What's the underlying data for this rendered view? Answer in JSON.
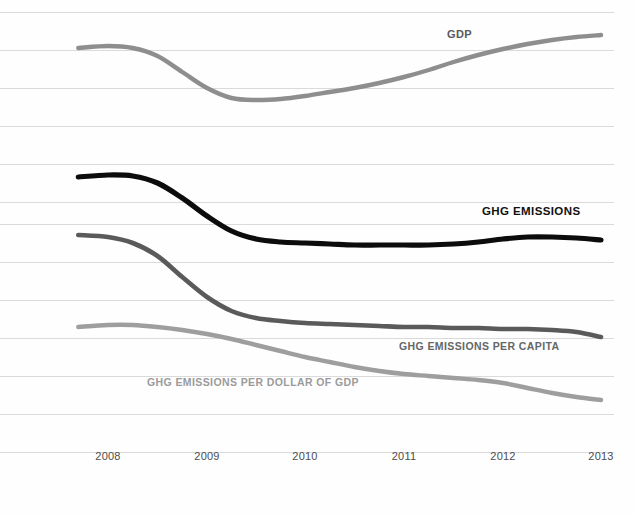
{
  "chart_data": {
    "type": "line",
    "title": "U.S. GDP and Greenhouse Gas Emissions Indexed Trends, 2008-2013",
    "xlabel": "",
    "ylabel": "",
    "grid": true,
    "gridlines_y": [
      12,
      50,
      88,
      126,
      164,
      202,
      224,
      262,
      300,
      338,
      376,
      414,
      452
    ],
    "legend_position": "inline-labels",
    "xlim": [
      2007.7,
      2013.0
    ],
    "x_ticks": [
      "2008",
      "2009",
      "2010",
      "2011",
      "2012",
      "2013"
    ],
    "x_tick_positions_px": [
      108,
      207,
      305,
      404,
      503,
      601
    ],
    "x": [
      2007.7,
      2008.0,
      2008.25,
      2008.5,
      2008.75,
      2009.0,
      2009.25,
      2009.5,
      2009.75,
      2010.0,
      2010.25,
      2010.5,
      2010.75,
      2011.0,
      2011.25,
      2011.5,
      2011.75,
      2012.0,
      2012.25,
      2012.5,
      2012.75,
      2013.0
    ],
    "series": [
      {
        "name": "GDP",
        "label": "GDP",
        "color": "#8e8e8e",
        "width": 4.4,
        "values_px_y": [
          48,
          46,
          48,
          56,
          72,
          88,
          98,
          100,
          99,
          96,
          92,
          88,
          83,
          77,
          70,
          62,
          55,
          49,
          44,
          40,
          37,
          35
        ],
        "label_x_px": 447,
        "label_y_px": 28
      },
      {
        "name": "GHG EMISSIONS",
        "label": "GHG EMISSIONS",
        "color": "#0c0c0c",
        "width": 5.2,
        "values_px_y": [
          177,
          175,
          176,
          183,
          198,
          216,
          231,
          239,
          242,
          243,
          244,
          245,
          245,
          245,
          245,
          244,
          242,
          239,
          237,
          237,
          238,
          240
        ],
        "label_x_px": 482,
        "label_y_px": 205
      },
      {
        "name": "GHG EMISSIONS PER CAPITA",
        "label": "GHG EMISSIONS PER CAPITA",
        "color": "#5a5a5a",
        "width": 4.6,
        "values_px_y": [
          235,
          237,
          243,
          256,
          277,
          297,
          311,
          318,
          321,
          323,
          324,
          325,
          326,
          327,
          327,
          328,
          328,
          329,
          329,
          330,
          332,
          337
        ],
        "label_x_px": 399,
        "label_y_px": 340
      },
      {
        "name": "GHG EMISSIONS PER DOLLAR OF GDP",
        "label": "GHG EMISSIONS PER DOLLAR OF GDP",
        "color": "#9e9e9e",
        "width": 4.4,
        "values_px_y": [
          327,
          325,
          325,
          327,
          330,
          334,
          339,
          345,
          351,
          357,
          362,
          367,
          371,
          374,
          376,
          378,
          380,
          383,
          388,
          393,
          397,
          400
        ],
        "label_x_px": 147,
        "label_y_px": 376
      }
    ]
  },
  "axis": {
    "ticks": [
      {
        "label": "2008",
        "x": 108
      },
      {
        "label": "2009",
        "x": 207
      },
      {
        "label": "2010",
        "x": 305
      },
      {
        "label": "2011",
        "x": 404
      },
      {
        "label": "2012",
        "x": 503
      },
      {
        "label": "2013",
        "x": 601
      }
    ]
  },
  "labels": {
    "gdp": "GDP",
    "ghg_emissions": "GHG EMISSIONS",
    "ghg_per_capita": "GHG EMISSIONS PER CAPITA",
    "ghg_per_dollar_gdp": "GHG EMISSIONS PER DOLLAR OF GDP"
  },
  "colors": {
    "gdp": "#8e8e8e",
    "ghg_emissions": "#0c0c0c",
    "ghg_per_capita": "#5a5a5a",
    "ghg_per_dollar_gdp": "#9e9e9e",
    "gridline": "#d6d6d6",
    "background": "#fefefe",
    "tick_text": "#4d4d4d"
  }
}
